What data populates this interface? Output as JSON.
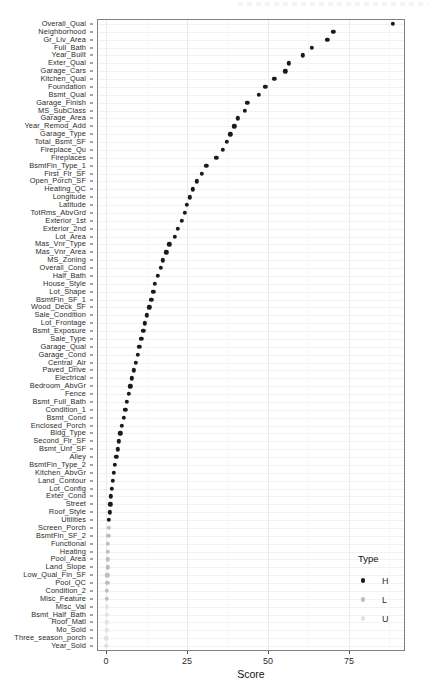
{
  "chart_data": {
    "type": "scatter",
    "title": "",
    "xlabel": "Score",
    "ylabel": "",
    "xlim": [
      -2.5,
      92
    ],
    "xticks": [
      0,
      25,
      50,
      75
    ],
    "xticklabels": [
      "0",
      "25",
      "50",
      "75"
    ],
    "grid": true,
    "legend": {
      "title": "Type",
      "position": "right-bottom",
      "entries": [
        {
          "label": "H",
          "color": "#1a1a1a"
        },
        {
          "label": "L",
          "color": "#bdbdbd"
        },
        {
          "label": "U",
          "color": "#e2e2e2"
        }
      ]
    },
    "categories": [
      "Overall_Qual",
      "Neighborhood",
      "Gr_Liv_Area",
      "Full_Bath",
      "Year_Built",
      "Exter_Qual",
      "Garage_Cars",
      "Kitchen_Qual",
      "Foundation",
      "Bsmt_Qual",
      "Garage_Finish",
      "MS_SubClass",
      "Garage_Area",
      "Year_Remod_Add",
      "Garage_Type",
      "Total_Bsmt_SF",
      "Fireplace_Qu",
      "Fireplaces",
      "BsmtFin_Type_1",
      "First_Flr_SF",
      "Open_Porch_SF",
      "Heating_QC",
      "Longitude",
      "Latitude",
      "TotRms_AbvGrd",
      "Exterior_1st",
      "Exterior_2nd",
      "Lot_Area",
      "Mas_Vnr_Type",
      "Mas_Vnr_Area",
      "MS_Zoning",
      "Overall_Cond",
      "Half_Bath",
      "House_Style",
      "Lot_Shape",
      "BsmtFin_SF_1",
      "Wood_Deck_SF",
      "Sale_Condition",
      "Lot_Frontage",
      "Bsmt_Exposure",
      "Sale_Type",
      "Garage_Qual",
      "Garage_Cond",
      "Central_Air",
      "Paved_Drive",
      "Electrical",
      "Bedroom_AbvGr",
      "Fence",
      "Bsmt_Full_Bath",
      "Condition_1",
      "Bsmt_Cond",
      "Enclosed_Porch",
      "Bldg_Type",
      "Second_Flr_SF",
      "Bsmt_Unf_SF",
      "Alley",
      "BsmtFin_Type_2",
      "Kitchen_AbvGr",
      "Land_Contour",
      "Lot_Config",
      "Exter_Cond",
      "Street",
      "Roof_Style",
      "Utilities",
      "Screen_Porch",
      "BsmtFin_SF_2",
      "Functional",
      "Heating",
      "Pool_Area",
      "Land_Slope",
      "Low_Qual_Fin_SF",
      "Pool_QC",
      "Condition_2",
      "Misc_Feature",
      "Misc_Val",
      "Bsmt_Half_Bath",
      "Roof_Matl",
      "Mo_Sold",
      "Three_season_porch",
      "Year_Sold"
    ],
    "values": [
      88.5,
      70.2,
      68.3,
      63.5,
      60.8,
      56.5,
      55.3,
      52.0,
      49.2,
      47.2,
      43.6,
      42.8,
      40.6,
      39.6,
      38.4,
      37.2,
      36.0,
      34.0,
      31.0,
      29.6,
      28.0,
      26.8,
      25.8,
      25.0,
      24.3,
      23.3,
      22.2,
      21.3,
      19.5,
      18.6,
      17.6,
      16.9,
      16.0,
      15.1,
      14.6,
      14.0,
      13.3,
      12.6,
      12.0,
      11.5,
      10.9,
      10.2,
      9.7,
      9.1,
      8.5,
      8.0,
      7.5,
      7.0,
      6.4,
      5.9,
      5.4,
      4.9,
      4.4,
      4.0,
      3.6,
      3.2,
      2.7,
      2.3,
      2.0,
      1.7,
      1.5,
      1.3,
      1.1,
      0.9,
      0.8,
      0.7,
      0.6,
      0.6,
      0.5,
      0.5,
      0.4,
      0.4,
      0.3,
      0.3,
      0.3,
      0.2,
      0.2,
      0.2,
      0.1,
      0.1
    ],
    "types": [
      "H",
      "H",
      "H",
      "H",
      "H",
      "H",
      "H",
      "H",
      "H",
      "H",
      "H",
      "H",
      "H",
      "H",
      "H",
      "H",
      "H",
      "H",
      "H",
      "H",
      "H",
      "H",
      "H",
      "H",
      "H",
      "H",
      "H",
      "H",
      "H",
      "H",
      "H",
      "H",
      "H",
      "H",
      "H",
      "H",
      "H",
      "H",
      "H",
      "H",
      "H",
      "H",
      "H",
      "H",
      "H",
      "H",
      "H",
      "H",
      "H",
      "H",
      "H",
      "H",
      "H",
      "H",
      "H",
      "H",
      "H",
      "H",
      "H",
      "H",
      "H",
      "H",
      "H",
      "H",
      "L",
      "L",
      "L",
      "L",
      "L",
      "L",
      "L",
      "L",
      "L",
      "L",
      "U",
      "U",
      "U",
      "U",
      "U",
      "U"
    ]
  }
}
